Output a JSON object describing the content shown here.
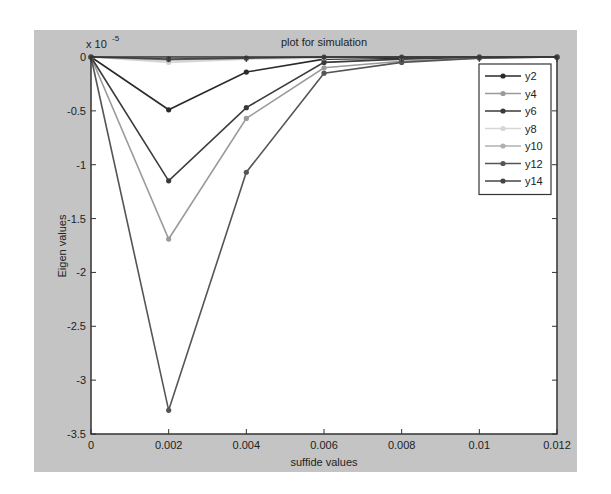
{
  "chart_data": {
    "type": "line",
    "title": "plot for simulation",
    "xlabel": "suffide values",
    "ylabel": "Eigen values",
    "y_multiplier": "x 10",
    "y_exponent": "-5",
    "xlim": [
      0,
      0.012
    ],
    "ylim": [
      -3.5,
      0
    ],
    "grid": false,
    "legend_position": "upper right",
    "xticks": [
      0,
      0.002,
      0.004,
      0.006,
      0.008,
      0.01,
      0.012
    ],
    "xtick_labels": [
      "0",
      "0.002",
      "0.004",
      "0.006",
      "0.008",
      "0.01",
      "0.012"
    ],
    "yticks": [
      0,
      -0.5,
      -1,
      -1.5,
      -2,
      -2.5,
      -3,
      -3.5
    ],
    "ytick_labels": [
      "0",
      "-0.5",
      "-1",
      "-1.5",
      "-2",
      "-2.5",
      "-3",
      "-3.5"
    ],
    "x": [
      0,
      0.002,
      0.004,
      0.006,
      0.008,
      0.01,
      0.012
    ],
    "series": [
      {
        "name": "y2",
        "color": "#2a2a2a",
        "values": [
          0,
          -0.49,
          -0.14,
          -0.02,
          -0.01,
          0,
          0
        ]
      },
      {
        "name": "y4",
        "color": "#9a9a9a",
        "values": [
          0,
          -1.69,
          -0.57,
          -0.1,
          -0.04,
          -0.01,
          0
        ]
      },
      {
        "name": "y6",
        "color": "#3a3a3a",
        "values": [
          0,
          -1.15,
          -0.47,
          -0.05,
          -0.02,
          0,
          0
        ]
      },
      {
        "name": "y8",
        "color": "#d6d6d6",
        "values": [
          0,
          -0.05,
          -0.02,
          -0.01,
          0,
          0,
          0
        ]
      },
      {
        "name": "y10",
        "color": "#b0b0b0",
        "values": [
          0,
          -0.03,
          -0.01,
          0,
          0,
          0,
          0
        ]
      },
      {
        "name": "y12",
        "color": "#555555",
        "values": [
          0,
          -3.28,
          -1.07,
          -0.15,
          -0.05,
          -0.01,
          0
        ]
      },
      {
        "name": "y14",
        "color": "#444444",
        "values": [
          0,
          -0.02,
          -0.01,
          0,
          0,
          0,
          0
        ]
      }
    ]
  }
}
